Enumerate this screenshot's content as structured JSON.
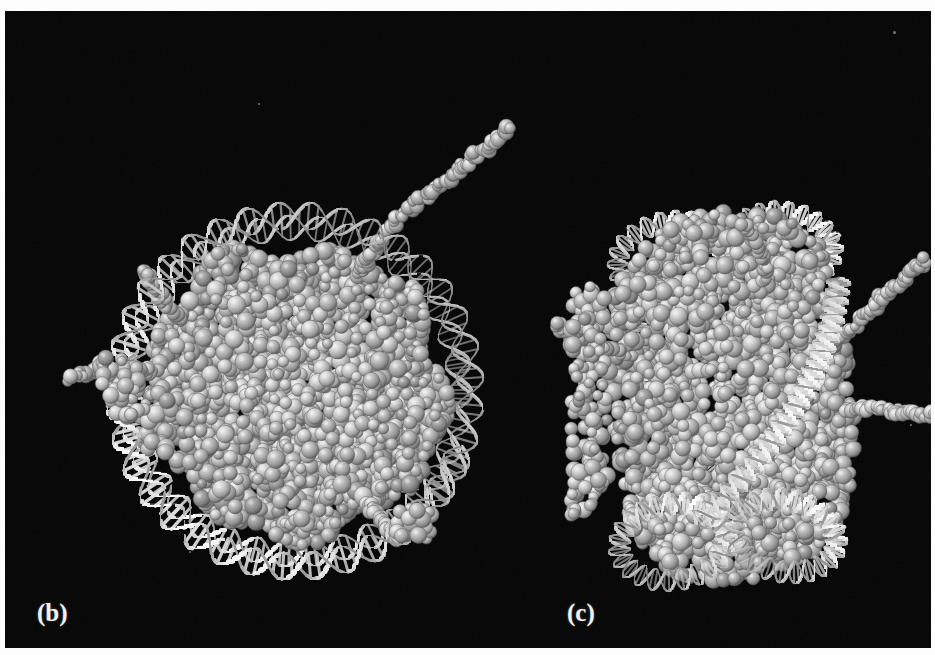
{
  "figure": {
    "kind": "molecular-structure-figure",
    "background_color": "#050505",
    "border_color": "#ffffff",
    "plate": {
      "x": 5,
      "y": 11,
      "width": 926,
      "height": 637
    }
  },
  "panels": [
    {
      "id": "b",
      "label": "(b)",
      "label_x": 32,
      "label_y": 588,
      "view": "down the superhelical axis (disc face view)",
      "center_x": 290,
      "center_y": 380,
      "core_radius": 150,
      "dna_turns": 1.65,
      "dna_ribbon_color": "#e9e9e9",
      "core_sphere_color": "#b2b2b2",
      "tails": [
        {
          "name": "tail-top-right",
          "angle": -62,
          "length": 215,
          "curl": 38
        },
        {
          "name": "tail-left",
          "angle": 188,
          "length": 96,
          "curl": -26
        },
        {
          "name": "tail-lower-left",
          "angle": 212,
          "length": 64,
          "curl": 18
        },
        {
          "name": "tail-lower-right",
          "angle": 58,
          "length": 52,
          "curl": -16
        }
      ]
    },
    {
      "id": "c",
      "label": "(c)",
      "label_x": 562,
      "label_y": 588,
      "view": "perpendicular to the superhelical axis (edge-on view)",
      "center_x": 726,
      "center_y": 385,
      "core_half_width": 118,
      "core_half_height": 185,
      "gyres": 2,
      "dna_ribbon_color": "#e9e9e9",
      "core_sphere_color": "#b2b2b2",
      "tails": [
        {
          "name": "tail-upper-right",
          "angle": -28,
          "length": 130,
          "curl": 14
        },
        {
          "name": "tail-right",
          "angle": 6,
          "length": 108,
          "curl": -10
        },
        {
          "name": "tail-upper-left",
          "angle": 200,
          "length": 78,
          "curl": 20
        },
        {
          "name": "tail-top",
          "angle": -72,
          "length": 68,
          "curl": -22
        }
      ]
    }
  ],
  "palette": {
    "black": "#050505",
    "dna_light": "#f1f1f1",
    "dna_mid": "#b8b8b8",
    "dna_shadow": "#6d6d6d",
    "protein_light": "#d2d2d2",
    "protein_mid": "#a0a0a0",
    "protein_dark": "#6a6a6a",
    "label_text": "#f2f2f2"
  },
  "specks": [
    {
      "name": "speck-top-right",
      "x": 888,
      "y": 20,
      "size": 3
    },
    {
      "name": "speck-mid-left",
      "x": 253,
      "y": 92,
      "size": 2
    },
    {
      "name": "speck-bottom-left",
      "x": 184,
      "y": 540,
      "size": 2
    },
    {
      "name": "speck-right",
      "x": 905,
      "y": 413,
      "size": 2
    }
  ]
}
